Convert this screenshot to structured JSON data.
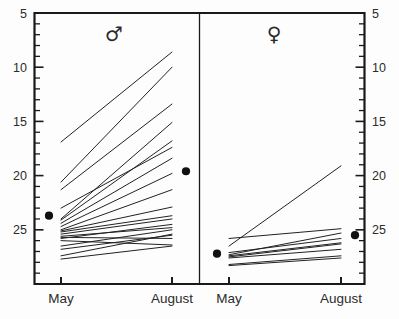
{
  "chart_data": {
    "type": "line",
    "title": "",
    "subtitle": "",
    "xlabel": "",
    "ylabel": "",
    "grid": false,
    "legend": "none",
    "categories": [
      "May",
      "August"
    ],
    "ylim": [
      0,
      25
    ],
    "yticks_major": [
      5,
      10,
      15,
      20,
      25
    ],
    "yticks_minor_step": 1,
    "ytick_labels": [
      "5",
      "10",
      "15",
      "20",
      "25"
    ],
    "axis_note": "Identical y axis drawn on the left and the right side of the figure",
    "panels": [
      {
        "name": "male",
        "symbol": "♂",
        "symbol_name": "mars-symbol",
        "x_tick_labels": [
          "May",
          "August"
        ],
        "mean": {
          "May": 6.3,
          "August": 10.4
        },
        "series": [
          {
            "name": "m1",
            "values": [
              13.1,
              21.4
            ]
          },
          {
            "name": "m2",
            "values": [
              9.4,
              20.0
            ]
          },
          {
            "name": "m3",
            "values": [
              8.7,
              16.6
            ]
          },
          {
            "name": "m4",
            "values": [
              6.0,
              14.9
            ]
          },
          {
            "name": "m5",
            "values": [
              5.9,
              13.2
            ]
          },
          {
            "name": "m6",
            "values": [
              7.0,
              12.6
            ]
          },
          {
            "name": "m7",
            "values": [
              5.6,
              11.6
            ]
          },
          {
            "name": "m8",
            "values": [
              5.3,
              10.2
            ]
          },
          {
            "name": "m9",
            "values": [
              5.0,
              8.7
            ]
          },
          {
            "name": "m10",
            "values": [
              4.9,
              7.1
            ]
          },
          {
            "name": "m11",
            "values": [
              4.8,
              6.3
            ]
          },
          {
            "name": "m12",
            "values": [
              4.6,
              6.0
            ]
          },
          {
            "name": "m13",
            "values": [
              4.4,
              5.2
            ]
          },
          {
            "name": "m14",
            "values": [
              4.2,
              5.5
            ]
          },
          {
            "name": "m15",
            "values": [
              4.3,
              4.2
            ]
          },
          {
            "name": "m16",
            "values": [
              4.0,
              3.6
            ]
          },
          {
            "name": "m17",
            "values": [
              3.5,
              5.0
            ]
          },
          {
            "name": "m18",
            "values": [
              3.2,
              4.5
            ]
          },
          {
            "name": "m19",
            "values": [
              2.6,
              4.6
            ]
          },
          {
            "name": "m20",
            "values": [
              2.3,
              3.5
            ]
          }
        ]
      },
      {
        "name": "female",
        "symbol": "♀",
        "symbol_name": "venus-symbol",
        "x_tick_labels": [
          "May",
          "August"
        ],
        "mean": {
          "May": 2.8,
          "August": 4.5
        },
        "series": [
          {
            "name": "f1",
            "values": [
              3.5,
              10.9
            ]
          },
          {
            "name": "f2",
            "values": [
              4.2,
              5.1
            ]
          },
          {
            "name": "f3",
            "values": [
              2.7,
              4.7
            ]
          },
          {
            "name": "f4",
            "values": [
              2.9,
              4.2
            ]
          },
          {
            "name": "f5",
            "values": [
              2.6,
              3.8
            ]
          },
          {
            "name": "f6",
            "values": [
              2.5,
              3.7
            ]
          },
          {
            "name": "f7",
            "values": [
              2.4,
              3.2
            ]
          },
          {
            "name": "f8",
            "values": [
              1.8,
              2.6
            ]
          },
          {
            "name": "f9",
            "values": [
              1.7,
              2.4
            ]
          }
        ]
      }
    ]
  },
  "labels": {
    "y_left": [
      "25",
      "20",
      "15",
      "10",
      "5"
    ],
    "y_right": [
      "25",
      "20",
      "15",
      "10",
      "5"
    ],
    "x_male_left": "May",
    "x_male_right": "August",
    "x_female_left": "May",
    "x_female_right": "August",
    "male_symbol": "♂",
    "female_symbol": "♀"
  }
}
